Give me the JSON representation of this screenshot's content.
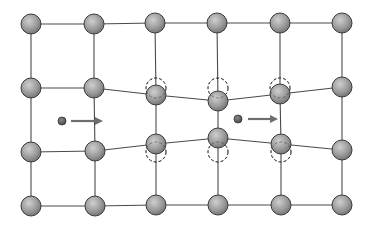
{
  "diagram": {
    "colors": {
      "atom_fill_light": "#c8c8c8",
      "atom_fill_dark": "#7a7a7a",
      "bond": "#4a4a4a",
      "arrow": "#6e6e6e",
      "interstitial": "#555555"
    },
    "atom_radius": 10,
    "atoms": [
      [
        [
          31,
          24
        ],
        [
          94,
          24
        ],
        [
          155,
          23
        ],
        [
          217,
          23
        ],
        [
          280,
          23
        ],
        [
          342,
          23
        ]
      ],
      [
        [
          31,
          88
        ],
        [
          94,
          88
        ],
        [
          156,
          95
        ],
        [
          218,
          101
        ],
        [
          280,
          94
        ],
        [
          342,
          87
        ]
      ],
      [
        [
          31,
          152
        ],
        [
          95,
          151
        ],
        [
          156,
          144
        ],
        [
          218,
          138
        ],
        [
          281,
          144
        ],
        [
          342,
          150
        ]
      ],
      [
        [
          31,
          206
        ],
        [
          95,
          206
        ],
        [
          156,
          205
        ],
        [
          218,
          205
        ],
        [
          281,
          205
        ],
        [
          342,
          205
        ]
      ]
    ],
    "ghost_positions": [
      [
        156,
        88
      ],
      [
        218,
        88
      ],
      [
        280,
        88
      ],
      [
        156,
        152
      ],
      [
        218,
        152
      ],
      [
        281,
        152
      ]
    ],
    "interstitials": [
      {
        "x": 62,
        "y": 121,
        "r": 4,
        "arrow_from": 71,
        "arrow_to": 103
      },
      {
        "x": 238,
        "y": 119,
        "r": 4,
        "arrow_from": 248,
        "arrow_to": 278
      }
    ]
  }
}
